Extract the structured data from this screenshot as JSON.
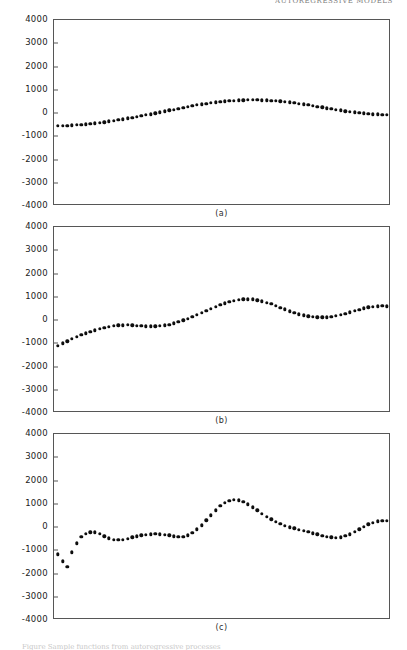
{
  "page": {
    "running_head": "AUTOREGRESSIVE  MODELS",
    "caption_fragment": "Figure   Sample   functions   from   autoregressive   processes",
    "background_color": "#ffffff",
    "ink_color": "#0d0d0d",
    "frame_color": "#565656"
  },
  "axis": {
    "y_ticklabels": [
      "4000",
      "3000",
      "2000",
      "1000",
      "0",
      "-1000",
      "-2000",
      "-3000",
      "-4000"
    ],
    "y_tickvalues": [
      4000,
      3000,
      2000,
      1000,
      0,
      -1000,
      -2000,
      -3000,
      -4000
    ],
    "ylim": [
      -4000,
      4000
    ],
    "xlim": [
      0,
      71
    ],
    "grid": false
  },
  "panels": [
    {
      "label": "(a)",
      "top": 19,
      "height": 186,
      "label_top": 206
    },
    {
      "label": "(b)",
      "top": 226,
      "height": 186,
      "label_top": 413
    },
    {
      "label": "(c)",
      "top": 433,
      "height": 186,
      "label_top": 620
    }
  ],
  "chart_data": [
    {
      "type": "scatter",
      "title": "(a)",
      "xlabel": "",
      "ylabel": "",
      "ylim": [
        -4000,
        4000
      ],
      "xlim": [
        0,
        71
      ],
      "yticks": [
        -4000,
        -3000,
        -2000,
        -1000,
        0,
        1000,
        2000,
        3000,
        4000
      ],
      "grid": false,
      "legend": "none",
      "series": [
        {
          "name": "series-a",
          "x": [
            0,
            1,
            2,
            3,
            4,
            5,
            6,
            7,
            8,
            9,
            10,
            11,
            12,
            13,
            14,
            15,
            16,
            17,
            18,
            19,
            20,
            21,
            22,
            23,
            24,
            25,
            26,
            27,
            28,
            29,
            30,
            31,
            32,
            33,
            34,
            35,
            36,
            37,
            38,
            39,
            40,
            41,
            42,
            43,
            44,
            45,
            46,
            47,
            48,
            49,
            50,
            51,
            52,
            53,
            54,
            55,
            56,
            57,
            58,
            59,
            60,
            61,
            62,
            63,
            64,
            65,
            66,
            67,
            68,
            69,
            70,
            71
          ],
          "values": [
            -560,
            -555,
            -545,
            -535,
            -520,
            -505,
            -485,
            -465,
            -445,
            -420,
            -395,
            -365,
            -335,
            -305,
            -270,
            -235,
            -200,
            -165,
            -125,
            -90,
            -50,
            -10,
            30,
            70,
            110,
            150,
            190,
            230,
            270,
            305,
            340,
            375,
            405,
            435,
            460,
            485,
            505,
            520,
            535,
            545,
            552,
            556,
            557,
            555,
            550,
            542,
            530,
            515,
            498,
            478,
            455,
            430,
            402,
            372,
            340,
            305,
            272,
            238,
            205,
            172,
            140,
            110,
            80,
            52,
            25,
            0,
            -20,
            -38,
            -52,
            -62,
            -68,
            -70
          ]
        }
      ]
    },
    {
      "type": "scatter",
      "title": "(b)",
      "xlabel": "",
      "ylabel": "",
      "ylim": [
        -4000,
        4000
      ],
      "xlim": [
        0,
        71
      ],
      "yticks": [
        -4000,
        -3000,
        -2000,
        -1000,
        0,
        1000,
        2000,
        3000,
        4000
      ],
      "grid": false,
      "legend": "none",
      "series": [
        {
          "name": "series-b",
          "x": [
            0,
            1,
            2,
            3,
            4,
            5,
            6,
            7,
            8,
            9,
            10,
            11,
            12,
            13,
            14,
            15,
            16,
            17,
            18,
            19,
            20,
            21,
            22,
            23,
            24,
            25,
            26,
            27,
            28,
            29,
            30,
            31,
            32,
            33,
            34,
            35,
            36,
            37,
            38,
            39,
            40,
            41,
            42,
            43,
            44,
            45,
            46,
            47,
            48,
            49,
            50,
            51,
            52,
            53,
            54,
            55,
            56,
            57,
            58,
            59,
            60,
            61,
            62,
            63,
            64,
            65,
            66,
            67,
            68,
            69,
            70,
            71
          ],
          "values": [
            -1100,
            -1010,
            -915,
            -820,
            -730,
            -648,
            -572,
            -500,
            -436,
            -380,
            -330,
            -288,
            -255,
            -232,
            -220,
            -218,
            -225,
            -240,
            -258,
            -272,
            -278,
            -272,
            -258,
            -235,
            -200,
            -150,
            -88,
            -18,
            58,
            140,
            225,
            312,
            400,
            488,
            570,
            648,
            718,
            780,
            830,
            868,
            890,
            895,
            882,
            852,
            808,
            752,
            685,
            612,
            535,
            458,
            382,
            312,
            250,
            198,
            158,
            130,
            115,
            112,
            122,
            145,
            180,
            225,
            278,
            335,
            392,
            448,
            498,
            540,
            572,
            592,
            598,
            592
          ]
        }
      ]
    },
    {
      "type": "scatter",
      "title": "(c)",
      "xlabel": "",
      "ylabel": "",
      "ylim": [
        -4000,
        4000
      ],
      "xlim": [
        0,
        71
      ],
      "yticks": [
        -4000,
        -3000,
        -2000,
        -1000,
        0,
        1000,
        2000,
        3000,
        4000
      ],
      "grid": false,
      "legend": "none",
      "series": [
        {
          "name": "series-c",
          "x": [
            0,
            1,
            2,
            3,
            4,
            5,
            6,
            7,
            8,
            9,
            10,
            11,
            12,
            13,
            14,
            15,
            16,
            17,
            18,
            19,
            20,
            21,
            22,
            23,
            24,
            25,
            26,
            27,
            28,
            29,
            30,
            31,
            32,
            33,
            34,
            35,
            36,
            37,
            38,
            39,
            40,
            41,
            42,
            43,
            44,
            45,
            46,
            47,
            48,
            49,
            50,
            51,
            52,
            53,
            54,
            55,
            56,
            57,
            58,
            59,
            60,
            61,
            62,
            63,
            64,
            65,
            66,
            67,
            68,
            69,
            70,
            71
          ],
          "values": [
            -1180,
            -1480,
            -1700,
            -1090,
            -700,
            -430,
            -280,
            -230,
            -235,
            -300,
            -400,
            -490,
            -545,
            -560,
            -540,
            -500,
            -450,
            -400,
            -360,
            -330,
            -312,
            -305,
            -312,
            -330,
            -360,
            -400,
            -430,
            -420,
            -360,
            -250,
            -100,
            80,
            290,
            510,
            720,
            900,
            1040,
            1130,
            1170,
            1150,
            1080,
            975,
            850,
            715,
            580,
            450,
            330,
            220,
            125,
            50,
            -10,
            -60,
            -110,
            -160,
            -210,
            -265,
            -320,
            -375,
            -420,
            -450,
            -460,
            -440,
            -390,
            -310,
            -210,
            -100,
            10,
            110,
            190,
            245,
            270,
            265
          ]
        }
      ]
    }
  ]
}
